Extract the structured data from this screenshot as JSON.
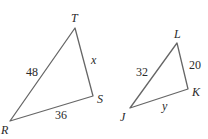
{
  "diagram": {
    "triangles": [
      {
        "name": "triangle-RST",
        "vertices": [
          {
            "label": "T",
            "x": 75,
            "y": 28,
            "lx": 71,
            "ly": 22
          },
          {
            "label": "R",
            "x": 10,
            "y": 121,
            "lx": 1,
            "ly": 134
          },
          {
            "label": "S",
            "x": 93,
            "y": 96,
            "lx": 97,
            "ly": 103
          }
        ],
        "sides": [
          {
            "between": "RT",
            "value": "48",
            "lx": 26,
            "ly": 76
          },
          {
            "between": "TS",
            "value": "x",
            "lx": 91,
            "ly": 64
          },
          {
            "between": "RS",
            "value": "36",
            "lx": 55,
            "ly": 119
          }
        ]
      },
      {
        "name": "triangle-JKL",
        "vertices": [
          {
            "label": "L",
            "x": 177,
            "y": 43,
            "lx": 174,
            "ly": 38
          },
          {
            "label": "K",
            "x": 188,
            "y": 89,
            "lx": 192,
            "ly": 96
          },
          {
            "label": "J",
            "x": 130,
            "y": 108,
            "lx": 120,
            "ly": 121
          }
        ],
        "sides": [
          {
            "between": "JL",
            "value": "32",
            "lx": 136,
            "ly": 76
          },
          {
            "between": "LK",
            "value": "20",
            "lx": 189,
            "ly": 69
          },
          {
            "between": "JK",
            "value": "y",
            "lx": 162,
            "ly": 110
          }
        ]
      }
    ]
  }
}
